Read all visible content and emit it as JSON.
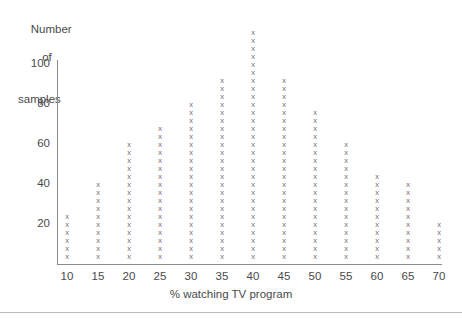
{
  "chart_data": {
    "type": "scatter",
    "title": "",
    "ylabel_lines": [
      "Number",
      "of",
      "samples"
    ],
    "ylabel": "Number of samples",
    "xlabel": "% watching TV program",
    "marker_glyph": "x",
    "marker_unit": 4,
    "grid": false,
    "legend": null,
    "axis_color": "#8e8e8e",
    "marker_color": "#707070",
    "text_color": "#4a4a4a",
    "background": "#ffffff",
    "xlim": [
      7.5,
      72.5
    ],
    "ylim": [
      0,
      118
    ],
    "yticks": [
      20,
      40,
      60,
      80,
      100
    ],
    "ytick_labels": [
      "20",
      "40",
      "60",
      "80",
      "100"
    ],
    "xticks": [
      10,
      15,
      20,
      25,
      30,
      35,
      40,
      45,
      50,
      55,
      60,
      65,
      70
    ],
    "xtick_labels": [
      "10",
      "15",
      "20",
      "25",
      "30",
      "35",
      "40",
      "45",
      "50",
      "55",
      "60",
      "65",
      "70"
    ],
    "categories": [
      10,
      15,
      20,
      25,
      30,
      35,
      40,
      45,
      50,
      55,
      60,
      65,
      70
    ],
    "values": [
      25,
      40,
      60,
      67,
      80,
      93,
      114,
      93,
      75,
      60,
      45,
      39,
      18
    ]
  }
}
